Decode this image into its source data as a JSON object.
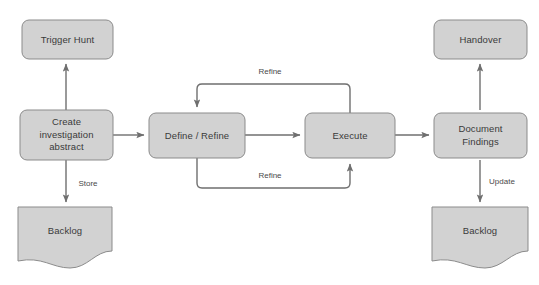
{
  "diagram": {
    "colors": {
      "node_fill": "#d2d2d2",
      "node_stroke": "#8b8b8b",
      "edge_stroke": "#6f6f6f",
      "label_text": "#3a3a3a",
      "background": "#ffffff"
    },
    "nodes": [
      {
        "id": "trigger_hunt",
        "label": "Trigger Hunt",
        "shape": "rounded-rect"
      },
      {
        "id": "create_investigation_abstract",
        "label_line1": "Create",
        "label_line2": "investigation",
        "label_line3": "abstract",
        "shape": "rounded-rect"
      },
      {
        "id": "backlog_left",
        "label": "Backlog",
        "shape": "document"
      },
      {
        "id": "define_refine",
        "label": "Define / Refine",
        "shape": "rounded-rect"
      },
      {
        "id": "execute",
        "label": "Execute",
        "shape": "rounded-rect"
      },
      {
        "id": "handover",
        "label": "Handover",
        "shape": "rounded-rect"
      },
      {
        "id": "document_findings",
        "label_line1": "Document",
        "label_line2": "Findings",
        "shape": "rounded-rect"
      },
      {
        "id": "backlog_right",
        "label": "Backlog",
        "shape": "document"
      }
    ],
    "edges": [
      {
        "id": "e-create-to-trigger",
        "from": "create_investigation_abstract",
        "to": "trigger_hunt",
        "label": ""
      },
      {
        "id": "e-create-to-backlog",
        "from": "create_investigation_abstract",
        "to": "backlog_left",
        "label": "Store"
      },
      {
        "id": "e-create-to-define",
        "from": "create_investigation_abstract",
        "to": "define_refine",
        "label": ""
      },
      {
        "id": "e-define-to-execute",
        "from": "define_refine",
        "to": "execute",
        "label": ""
      },
      {
        "id": "e-execute-to-define-top",
        "from": "execute",
        "to": "define_refine",
        "label": "Refine"
      },
      {
        "id": "e-define-to-execute-bottom",
        "from": "define_refine",
        "to": "execute",
        "label": "Refine"
      },
      {
        "id": "e-execute-to-document",
        "from": "execute",
        "to": "document_findings",
        "label": ""
      },
      {
        "id": "e-document-to-handover",
        "from": "document_findings",
        "to": "handover",
        "label": ""
      },
      {
        "id": "e-document-to-backlog",
        "from": "document_findings",
        "to": "backlog_right",
        "label": "Update"
      }
    ],
    "edge_labels": {
      "store": "Store",
      "refine_top": "Refine",
      "refine_bottom": "Refine",
      "update": "Update"
    }
  }
}
